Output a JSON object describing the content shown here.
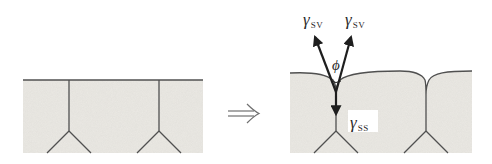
{
  "diagram": {
    "colors": {
      "line": "#505050",
      "vector": "#1e1e1e",
      "grain_fill": "#ebe9e4",
      "background": "#ffffff"
    },
    "panels": [
      {
        "id": "before",
        "description": "Flat surface with two grain boundaries meeting triple junctions"
      },
      {
        "id": "after",
        "description": "Thermally grooved surface with force balance at groove root"
      }
    ],
    "transition_arrow": "⟹",
    "labels": {
      "gamma_sv_left": {
        "symbol": "γ",
        "subscript": "SV"
      },
      "gamma_sv_right": {
        "symbol": "γ",
        "subscript": "SV"
      },
      "gamma_ss": {
        "symbol": "γ",
        "subscript": "SS"
      },
      "angle": "ϕ"
    }
  }
}
